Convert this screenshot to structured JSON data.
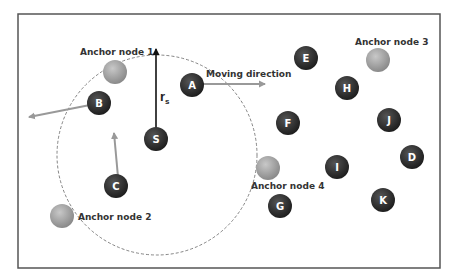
{
  "diagram": {
    "frame": {
      "x": 18,
      "y": 14,
      "w": 422,
      "h": 254,
      "stroke": "#555555"
    },
    "sensing_range": {
      "cx": 157,
      "cy": 155,
      "r": 100,
      "stroke": "#666666",
      "dash": "3,2"
    },
    "radius_label": {
      "main": "r",
      "sub": "s"
    },
    "moving_direction_label": "Moving direction",
    "colors": {
      "sensor_node": "#2b2b2b",
      "sensor_node_highlight": "#555555",
      "anchor_node": "#9a9a9a",
      "anchor_node_highlight": "#c8c8c8",
      "arrow_gray": "#999999",
      "arrow_black": "#111111"
    },
    "sensor_nodes": [
      {
        "id": "A",
        "cx": 192,
        "cy": 85
      },
      {
        "id": "B",
        "cx": 99,
        "cy": 103
      },
      {
        "id": "S",
        "cx": 156,
        "cy": 139
      },
      {
        "id": "C",
        "cx": 116,
        "cy": 186
      },
      {
        "id": "E",
        "cx": 306,
        "cy": 58
      },
      {
        "id": "H",
        "cx": 347,
        "cy": 88
      },
      {
        "id": "F",
        "cx": 288,
        "cy": 123
      },
      {
        "id": "J",
        "cx": 389,
        "cy": 120
      },
      {
        "id": "D",
        "cx": 412,
        "cy": 157
      },
      {
        "id": "I",
        "cx": 337,
        "cy": 167
      },
      {
        "id": "G",
        "cx": 280,
        "cy": 206
      },
      {
        "id": "K",
        "cx": 383,
        "cy": 200
      }
    ],
    "anchor_nodes": [
      {
        "label": "Anchor node 1",
        "cx": 115,
        "cy": 72,
        "lx": 80,
        "ly": 55
      },
      {
        "label": "Anchor node 2",
        "cx": 62,
        "cy": 216,
        "lx": 78,
        "ly": 220
      },
      {
        "label": "Anchor node 3",
        "cx": 378,
        "cy": 60,
        "lx": 355,
        "ly": 45
      },
      {
        "label": "Anchor node 4",
        "cx": 268,
        "cy": 168,
        "lx": 251,
        "ly": 189
      }
    ],
    "arrows": [
      {
        "name": "sensing-radius-arrow",
        "x1": 156,
        "y1": 129,
        "x2": 156,
        "y2": 49,
        "color": "black"
      },
      {
        "name": "node-a-direction-arrow",
        "x1": 201,
        "y1": 84,
        "x2": 265,
        "y2": 84,
        "color": "gray"
      },
      {
        "name": "node-b-direction-arrow",
        "x1": 90,
        "y1": 105,
        "x2": 29,
        "y2": 117,
        "color": "gray"
      },
      {
        "name": "node-c-direction-arrow",
        "x1": 118,
        "y1": 177,
        "x2": 114,
        "y2": 133,
        "color": "gray"
      }
    ]
  }
}
